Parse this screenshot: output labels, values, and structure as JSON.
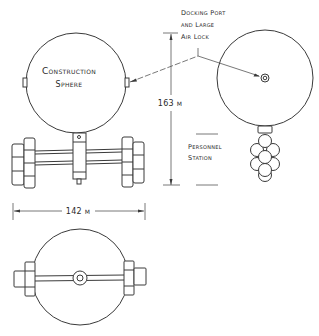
{
  "labels": {
    "construction_sphere": {
      "line1": "Construction",
      "line2": "Sphere"
    },
    "docking_port": {
      "line1": "Docking Port",
      "line2": "and Large",
      "line3": "Air Lock"
    },
    "personnel_station": {
      "line1": "Personnel",
      "line2": "Station"
    }
  },
  "dimensions": {
    "height": {
      "value": "163",
      "unit": "m",
      "text": "163 m"
    },
    "width": {
      "value": "142",
      "unit": "m",
      "text": "142 m"
    }
  },
  "views": [
    "side-view",
    "bottom-view"
  ],
  "colors": {
    "ink": "#3a3a3a",
    "background": "#ffffff"
  }
}
